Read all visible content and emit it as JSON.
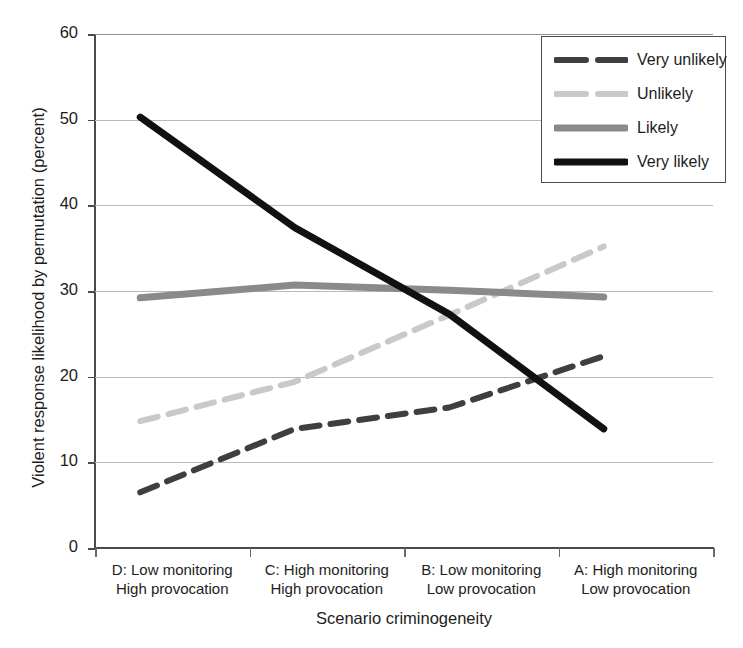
{
  "chart_data": {
    "type": "line",
    "title": "",
    "xlabel": "Scenario criminogeneity",
    "ylabel": "Violent response likelihood by permutation (percent)",
    "categories": [
      "D: Low monitoring\nHigh provocation",
      "C: High monitoring\nHigh provocation",
      "B: Low monitoring\nLow provocation",
      "A: High monitoring\nLow provocation"
    ],
    "category_lines": [
      [
        "D: Low monitoring",
        "High provocation"
      ],
      [
        "C: High monitoring",
        "High provocation"
      ],
      [
        "B: Low monitoring",
        "Low provocation"
      ],
      [
        "A: High monitoring",
        "Low provocation"
      ]
    ],
    "ylim": [
      0,
      60
    ],
    "yticks": [
      0,
      10,
      20,
      30,
      40,
      50,
      60
    ],
    "grid": true,
    "legend_position": "top-right",
    "series": [
      {
        "name": "Very unlikely",
        "values": [
          6.5,
          13.9,
          16.4,
          22.4
        ],
        "color": "#3f3f3f",
        "style": "dashed",
        "width": 6
      },
      {
        "name": "Unlikely",
        "values": [
          14.8,
          19.4,
          27.2,
          35.2
        ],
        "color": "#c9c9c9",
        "style": "dashed",
        "width": 6
      },
      {
        "name": "Likely",
        "values": [
          29.2,
          30.7,
          30.1,
          29.3
        ],
        "color": "#8a8a8a",
        "style": "solid",
        "width": 7
      },
      {
        "name": "Very likely",
        "values": [
          50.3,
          37.4,
          27.3,
          13.9
        ],
        "color": "#111111",
        "style": "solid",
        "width": 7
      }
    ]
  },
  "legend": {
    "items": [
      {
        "label": "Very unlikely"
      },
      {
        "label": "Unlikely"
      },
      {
        "label": "Likely"
      },
      {
        "label": "Very likely"
      }
    ]
  },
  "axes": {
    "ytick_labels": [
      "60",
      "50",
      "40",
      "30",
      "20",
      "10",
      "0"
    ]
  }
}
